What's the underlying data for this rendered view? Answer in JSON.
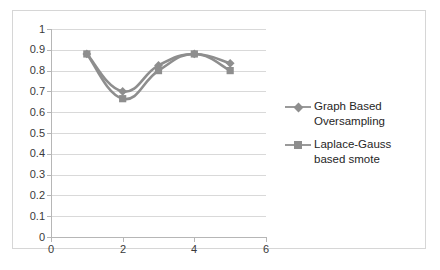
{
  "chart_data": {
    "type": "line",
    "title": "",
    "xlabel": "",
    "ylabel": "",
    "xlim": [
      0,
      6
    ],
    "ylim": [
      0,
      1
    ],
    "x": [
      1,
      2,
      3,
      4,
      5
    ],
    "grid": "horizontal",
    "legend_position": "right",
    "series": [
      {
        "name": "Graph Based Oversampling",
        "marker": "diamond",
        "color": "#8e8e8e",
        "values": [
          0.88,
          0.7,
          0.825,
          0.88,
          0.835
        ]
      },
      {
        "name": "Laplace-Gauss based smote",
        "marker": "square",
        "color": "#8e8e8e",
        "values": [
          0.88,
          0.665,
          0.8,
          0.88,
          0.8
        ]
      }
    ],
    "y_ticks": [
      "0",
      "0.1",
      "0.2",
      "0.3",
      "0.4",
      "0.5",
      "0.6",
      "0.7",
      "0.8",
      "0.9",
      "1"
    ],
    "y_tick_values": [
      0,
      0.1,
      0.2,
      0.3,
      0.4,
      0.5,
      0.6,
      0.7,
      0.8,
      0.9,
      1
    ],
    "x_ticks": [
      "0",
      "2",
      "4",
      "6"
    ],
    "x_tick_values": [
      0,
      2,
      4,
      6
    ]
  },
  "legend": {
    "entries": [
      {
        "label": "Graph Based Oversampling"
      },
      {
        "label": "Laplace-Gauss based smote"
      }
    ]
  },
  "colors": {
    "series": "#8e8e8e",
    "line": "#9a9a9a",
    "gridline": "#d9d9d9",
    "axis": "#b6b6b6",
    "border": "#d6d6d6",
    "text": "#3a3a3a",
    "background": "#ffffff"
  }
}
